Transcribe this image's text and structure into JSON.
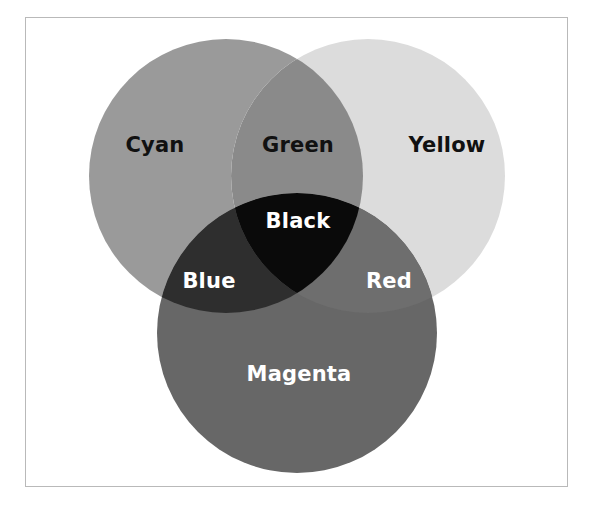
{
  "figure": {
    "background_color": "#ffffff",
    "frame": {
      "border_color": "#b9b9b9",
      "x": 25,
      "y": 17,
      "width": 543,
      "height": 470
    }
  },
  "chart_data": {
    "type": "diagram",
    "subtype": "venn-3-circle",
    "title": "",
    "grid": false,
    "legend": "none",
    "sets": [
      {
        "key": "cyan",
        "label": "Cyan",
        "fill": "#9a9a9a",
        "cx": 226,
        "cy": 176,
        "r": 137
      },
      {
        "key": "yellow",
        "label": "Yellow",
        "fill": "#dcdcdc",
        "cx": 368,
        "cy": 176,
        "r": 137
      },
      {
        "key": "magenta",
        "label": "Magenta",
        "fill": "#676767",
        "cx": 297,
        "cy": 333,
        "r": 140
      }
    ],
    "intersections": [
      {
        "key": "green",
        "label": "Green",
        "of": [
          "cyan",
          "yellow"
        ],
        "fill": "#8a8a8a"
      },
      {
        "key": "blue",
        "label": "Blue",
        "of": [
          "cyan",
          "magenta"
        ],
        "fill": "#2e2e2e"
      },
      {
        "key": "red",
        "label": "Red",
        "of": [
          "yellow",
          "magenta"
        ],
        "fill": "#6e6e6e"
      },
      {
        "key": "black",
        "label": "Black",
        "of": [
          "cyan",
          "yellow",
          "magenta"
        ],
        "fill": "#0a0a0a"
      }
    ],
    "labels": [
      {
        "key": "cyan",
        "text": "Cyan",
        "x": 155,
        "y": 145,
        "color": "#111111",
        "size": 21
      },
      {
        "key": "green",
        "text": "Green",
        "x": 298,
        "y": 145,
        "color": "#111111",
        "size": 21
      },
      {
        "key": "yellow",
        "text": "Yellow",
        "x": 447,
        "y": 145,
        "color": "#111111",
        "size": 21
      },
      {
        "key": "black",
        "text": "Black",
        "x": 298,
        "y": 221,
        "color": "#ffffff",
        "size": 21
      },
      {
        "key": "blue",
        "text": "Blue",
        "x": 209,
        "y": 281,
        "color": "#ffffff",
        "size": 21
      },
      {
        "key": "red",
        "text": "Red",
        "x": 389,
        "y": 281,
        "color": "#ffffff",
        "size": 21
      },
      {
        "key": "magenta",
        "text": "Magenta",
        "x": 299,
        "y": 374,
        "color": "#ffffff",
        "size": 21
      }
    ]
  }
}
